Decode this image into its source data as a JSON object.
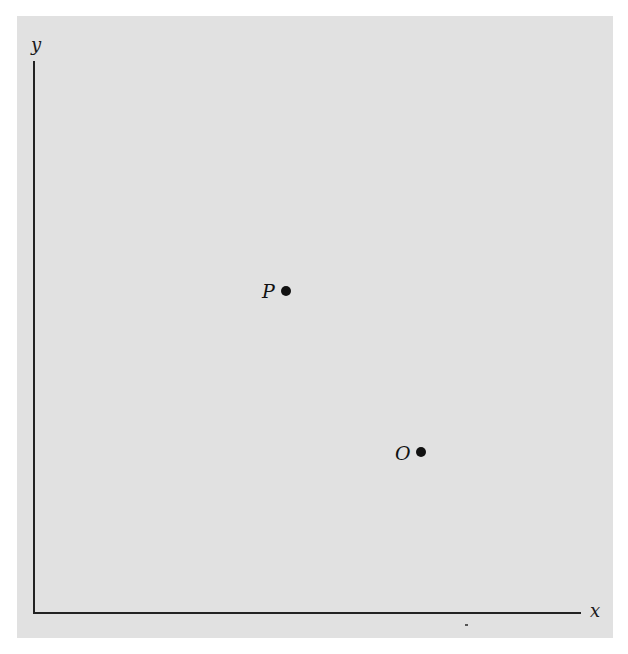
{
  "diagram": {
    "axes": {
      "x_label": "x",
      "y_label": "y"
    },
    "points": [
      {
        "label": "P",
        "x": 286,
        "y": 291
      },
      {
        "label": "O",
        "x": 421,
        "y": 452
      }
    ]
  },
  "colors": {
    "background": "#e1e1e1",
    "ink": "#111111"
  }
}
